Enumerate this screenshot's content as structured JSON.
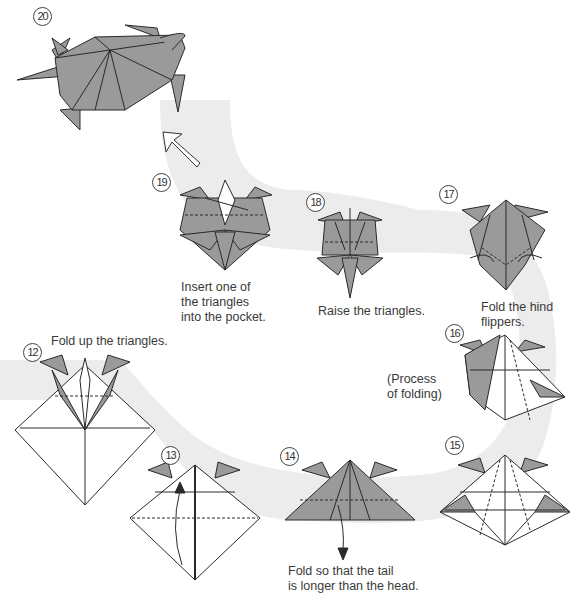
{
  "colors": {
    "paper_gray": "#9a9a9a",
    "paper_white": "#ffffff",
    "line": "#2a2a2a",
    "path_band": "#ececec"
  },
  "steps": [
    {
      "number": "12",
      "caption": "Fold up the triangles."
    },
    {
      "number": "13",
      "caption": ""
    },
    {
      "number": "14",
      "caption": "Fold so that the tail\nis longer than the head."
    },
    {
      "number": "15",
      "caption": ""
    },
    {
      "number": "16",
      "caption": "(Process\nof folding)"
    },
    {
      "number": "17",
      "caption": "Fold the hind\nflippers."
    },
    {
      "number": "18",
      "caption": "Raise the triangles."
    },
    {
      "number": "19",
      "caption": "Insert one of\nthe triangles\ninto the pocket."
    },
    {
      "number": "20",
      "caption": ""
    }
  ],
  "icons": {
    "flow_arrow": "hollow-arrow-up-left",
    "fold_arrow": "curved-arrow",
    "valley_fold": "dashed-line"
  }
}
